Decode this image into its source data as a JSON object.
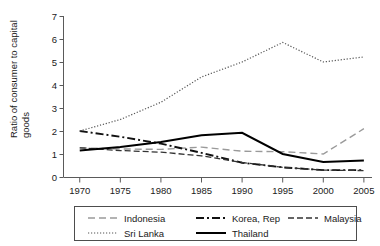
{
  "chart_data": {
    "type": "line",
    "title": "",
    "xlabel": "",
    "ylabel": "Ratio of consumer to capital goods",
    "ylabel_line1": "Ratio of consumer to capital",
    "ylabel_line2": "goods",
    "xlim": [
      1968,
      2006
    ],
    "ylim": [
      0,
      7
    ],
    "yticks": [
      0,
      1,
      2,
      3,
      4,
      5,
      6,
      7
    ],
    "ytick_labels": [
      "0",
      "1",
      "2",
      "3",
      "4",
      "5",
      "6",
      "7"
    ],
    "xticks": [
      1970,
      1975,
      1980,
      1985,
      1990,
      1995,
      2000,
      2005
    ],
    "xtick_labels": [
      "1970",
      "1975",
      "1980",
      "1985",
      "1990",
      "1995",
      "2000",
      "2005"
    ],
    "grid": false,
    "legend_position": "bottom",
    "x": [
      1970,
      1975,
      1980,
      1985,
      1990,
      1995,
      2000,
      2005
    ],
    "series": [
      {
        "name": "Indonesia",
        "values": [
          1.27,
          1.22,
          1.2,
          1.3,
          1.12,
          1.1,
          1.0,
          2.1
        ],
        "color": "#9a9a9a",
        "dash": "7,4",
        "width": 1.4
      },
      {
        "name": "Korea, Rep",
        "values": [
          2.0,
          1.75,
          1.45,
          1.05,
          0.62,
          0.42,
          0.3,
          0.3
        ],
        "color": "#111111",
        "dash": "8,3,2,3",
        "width": 1.9
      },
      {
        "name": "Malaysia",
        "values": [
          1.27,
          1.15,
          1.08,
          0.92,
          0.63,
          0.42,
          0.3,
          0.28
        ],
        "color": "#333333",
        "dash": "6,3",
        "width": 1.3
      },
      {
        "name": "Sri Lanka",
        "values": [
          2.0,
          2.5,
          3.25,
          4.35,
          5.0,
          5.85,
          5.0,
          5.22
        ],
        "color": "#555555",
        "dash": "1.2,1.8",
        "width": 1.2
      },
      {
        "name": "Thailand",
        "values": [
          1.15,
          1.3,
          1.52,
          1.82,
          1.92,
          1.0,
          0.65,
          0.72
        ],
        "color": "#000000",
        "dash": "",
        "width": 2.0
      }
    ],
    "legend_entries": [
      {
        "label": "Indonesia",
        "style": "long-dash",
        "color": "#9a9a9a"
      },
      {
        "label": "Korea, Rep",
        "style": "dash-dot",
        "color": "#111111"
      },
      {
        "label": "Malaysia",
        "style": "dash",
        "color": "#333333"
      },
      {
        "label": "Sri Lanka",
        "style": "dot",
        "color": "#555555"
      },
      {
        "label": "Thailand",
        "style": "solid",
        "color": "#000000"
      }
    ]
  }
}
